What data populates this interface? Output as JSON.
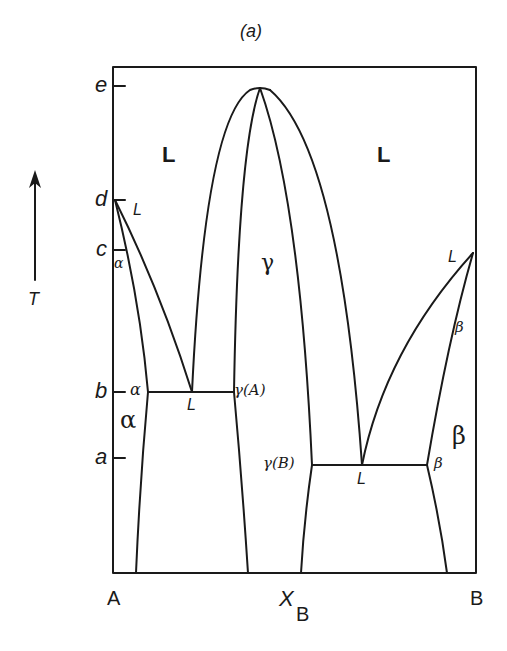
{
  "figure": {
    "panel_label": "(a)",
    "axis": {
      "x_label_main": "X",
      "x_label_sub": "B",
      "x_left": "A",
      "x_right": "B",
      "y_label": "T",
      "y_ticks": [
        "e",
        "d",
        "c",
        "b",
        "a"
      ]
    },
    "regions": {
      "liquid_left": "L",
      "liquid_right": "L",
      "gamma": "γ",
      "alpha": "α",
      "beta": "β"
    },
    "point_labels": {
      "d_L": "L",
      "c_alpha": "α",
      "b_alpha": "α",
      "b_L": "L",
      "b_gammaA": "γ(A)",
      "a_gammaB": "γ(B)",
      "a_L": "L",
      "a_beta": "β",
      "right_L": "L",
      "right_beta": "β"
    },
    "colors": {
      "line": "#1a1a1a",
      "background": "#ffffff"
    }
  }
}
